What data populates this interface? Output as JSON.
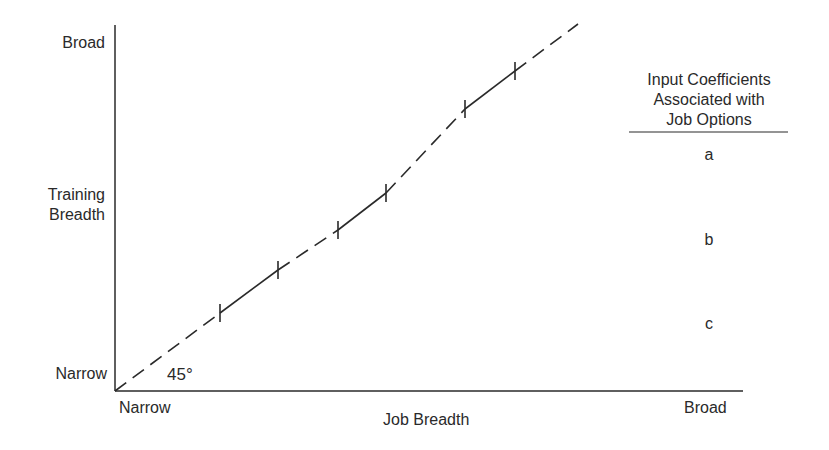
{
  "diagram": {
    "y_axis": {
      "title_line1": "Training",
      "title_line2": "Breadth",
      "top_label": "Broad",
      "bottom_label": "Narrow"
    },
    "x_axis": {
      "title": "Job Breadth",
      "left_label": "Narrow",
      "right_label": "Broad"
    },
    "angle_label": "45°",
    "legend": {
      "title_line1": "Input Coefficients",
      "title_line2": "Associated with",
      "title_line3": "Job Options",
      "items": [
        "a",
        "b",
        "c"
      ]
    },
    "diagonal": {
      "style": "dashed with solid segments between tick marks",
      "solid_segments": [
        {
          "name": "c",
          "from": [
            220,
            313
          ],
          "to": [
            278,
            270
          ]
        },
        {
          "name": "b",
          "from": [
            338,
            230
          ],
          "to": [
            386,
            193
          ]
        },
        {
          "name": "a",
          "from": [
            465,
            109
          ],
          "to": [
            515,
            71
          ]
        }
      ]
    },
    "colors": {
      "line": "#2a2a2a",
      "background": "#ffffff"
    }
  }
}
